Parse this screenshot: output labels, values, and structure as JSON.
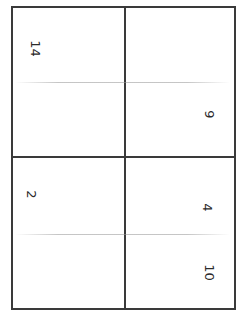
{
  "document": {
    "type": "hand-numbered grid sheet",
    "cells": [
      {
        "position": "top-left",
        "label": "14"
      },
      {
        "position": "top-right",
        "label": "9"
      },
      {
        "position": "bottom-left",
        "label": "2"
      },
      {
        "position": "bottom-right-upper",
        "label": "4"
      },
      {
        "position": "bottom-right-lower",
        "label": "10"
      }
    ],
    "colors": {
      "border": "#3a3a3a",
      "ink": "#2b2b2b",
      "background": "#ffffff"
    }
  }
}
